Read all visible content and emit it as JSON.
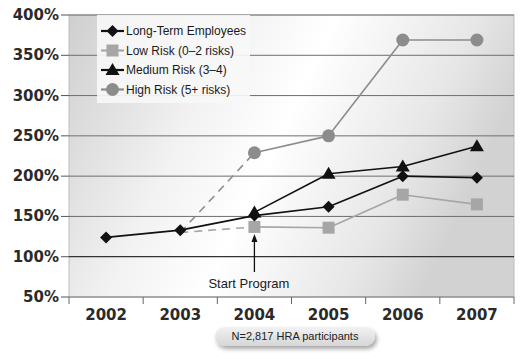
{
  "chart_data": {
    "type": "line",
    "title": "",
    "xlabel": "",
    "ylabel": "",
    "categories": [
      "2002",
      "2003",
      "2004",
      "2005",
      "2006",
      "2007"
    ],
    "ylim": [
      50,
      400
    ],
    "yticks": [
      50,
      100,
      150,
      200,
      250,
      300,
      350,
      400
    ],
    "ytick_labels": [
      "50%",
      "100%",
      "150%",
      "200%",
      "250%",
      "300%",
      "350%",
      "400%"
    ],
    "grid": true,
    "legend_position": "upper-left-inside",
    "series": [
      {
        "name": "Long-Term Employees",
        "marker": "diamond",
        "color": "#111111",
        "values": [
          124,
          133,
          151,
          162,
          200,
          198
        ]
      },
      {
        "name": "Low Risk (0–2 risks)",
        "marker": "square",
        "color": "#a6a6a6",
        "values": [
          null,
          130,
          137,
          136,
          177,
          165
        ],
        "dashed_segments": [
          [
            1,
            2
          ]
        ]
      },
      {
        "name": "Medium Risk (3–4)",
        "marker": "triangle",
        "color": "#111111",
        "values": [
          null,
          null,
          155,
          203,
          212,
          237
        ]
      },
      {
        "name": "High Risk (5+ risks)",
        "marker": "circle",
        "color": "#8c8c8c",
        "values": [
          null,
          130,
          229,
          250,
          369,
          369
        ],
        "dashed_segments": [
          [
            1,
            2
          ]
        ]
      }
    ],
    "annotations": [
      {
        "text": "Start Program",
        "x": "2004",
        "arrow": true
      }
    ],
    "note": "N=2,817 HRA participants"
  }
}
